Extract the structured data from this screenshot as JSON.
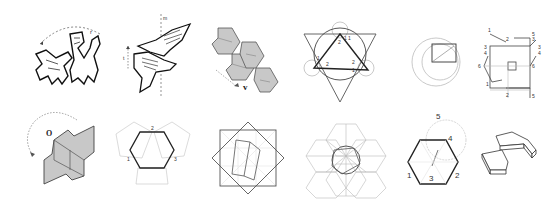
{
  "figure": {
    "layout": {
      "rows": 2,
      "columns": 6
    },
    "colors": {
      "stroke_dark": "#222222",
      "stroke_light": "#bbbbbb",
      "fill_gray": "#c8c8c8",
      "background": "#ffffff"
    },
    "panels": [
      {
        "id": "p1",
        "subject": "interlocking-animals-rotation",
        "labels": [
          "r"
        ]
      },
      {
        "id": "p2",
        "subject": "birds-glide-reflection",
        "labels": [
          "m",
          "t"
        ]
      },
      {
        "id": "p3",
        "subject": "hexagonal-tile-translation",
        "labels": [
          "v"
        ]
      },
      {
        "id": "p4",
        "subject": "triangle-circle-construction",
        "labels": [
          "1",
          "2",
          "1",
          "1",
          "2",
          "1",
          "2"
        ]
      },
      {
        "id": "p5",
        "subject": "circle-square-construction",
        "labels": []
      },
      {
        "id": "p6",
        "subject": "square-edge-correspondence",
        "labels": [
          "1",
          "2",
          "3",
          "3",
          "3",
          "4",
          "4",
          "5",
          "6",
          "6",
          "1",
          "2",
          "5"
        ]
      },
      {
        "id": "p7",
        "subject": "rotation-around-point-O",
        "labels": [
          "O"
        ]
      },
      {
        "id": "p8",
        "subject": "hexagon-with-pentagons",
        "labels": [
          "2",
          "1",
          "3"
        ]
      },
      {
        "id": "p9",
        "subject": "overlapping-squares-grid",
        "labels": []
      },
      {
        "id": "p10",
        "subject": "hexagonal-triangle-lattice",
        "labels": []
      },
      {
        "id": "p11",
        "subject": "hexagon-circle-numbering",
        "labels": [
          "5",
          "4",
          "1",
          "3",
          "2"
        ]
      },
      {
        "id": "p12",
        "subject": "3d-extruded-tiles",
        "labels": []
      }
    ]
  }
}
